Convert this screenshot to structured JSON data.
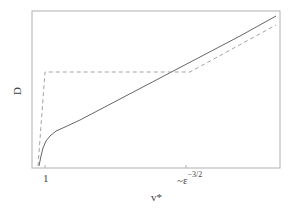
{
  "chart_data": {
    "type": "line",
    "title": "",
    "xlabel": "v*",
    "ylabel": "D",
    "x_ticks": [
      {
        "label": "1",
        "pos": 0.04
      },
      {
        "label": "~ε^{-3/2}",
        "pos": 0.62
      }
    ],
    "y_ticks": [],
    "grid": false,
    "legend": null,
    "series": [
      {
        "name": "solid",
        "style": "solid",
        "color": "#555555",
        "points_px": [
          [
            39,
            166
          ],
          [
            41,
            156
          ],
          [
            43,
            148
          ],
          [
            46,
            141
          ],
          [
            50,
            136
          ],
          [
            56,
            131
          ],
          [
            65,
            127
          ],
          [
            80,
            120
          ],
          [
            120,
            99
          ],
          [
            160,
            78
          ],
          [
            200,
            57
          ],
          [
            240,
            36
          ],
          [
            276,
            16
          ]
        ]
      },
      {
        "name": "dashed",
        "style": "dashed",
        "color": "#999999",
        "points_px": [
          [
            38,
            166
          ],
          [
            45,
            72
          ],
          [
            190,
            72
          ],
          [
            276,
            25
          ]
        ]
      }
    ],
    "frame_px": {
      "left": 32,
      "top": 11,
      "right": 280,
      "bottom": 168
    }
  },
  "labels": {
    "ylabel": "D",
    "xlabel": "v*",
    "tick_1": "1",
    "tick_eps_base": "~ε",
    "tick_eps_exp": "−3/2"
  }
}
